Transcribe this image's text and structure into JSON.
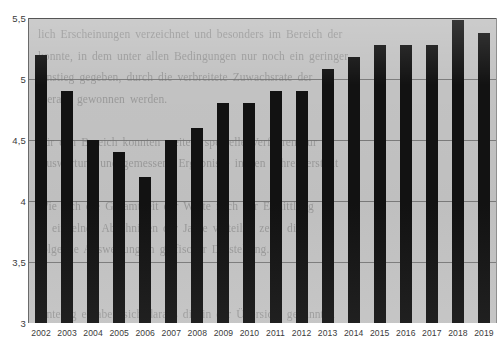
{
  "chart_data": {
    "type": "bar",
    "title": "",
    "subtitle": "",
    "xlabel": "",
    "ylabel": "",
    "categories": [
      "2002",
      "2003",
      "2004",
      "2005",
      "2006",
      "2007",
      "2008",
      "2009",
      "2010",
      "2011",
      "2012",
      "2013",
      "2014",
      "2015",
      "2016",
      "2017",
      "2018",
      "2019"
    ],
    "values": [
      5.2,
      4.9,
      4.5,
      4.4,
      4.2,
      4.5,
      4.6,
      4.8,
      4.8,
      4.9,
      4.9,
      5.08,
      5.18,
      5.28,
      5.28,
      5.28,
      5.48,
      5.38
    ],
    "series": [
      {
        "name": "",
        "values": [
          5.2,
          4.9,
          4.5,
          4.4,
          4.2,
          4.5,
          4.6,
          4.8,
          4.8,
          4.9,
          4.9,
          5.08,
          5.18,
          5.28,
          5.28,
          5.28,
          5.48,
          5.38
        ]
      }
    ],
    "ylim": [
      3,
      5.5
    ],
    "ytick_values": [
      5.5,
      5.0,
      4.5,
      4.0,
      3.5,
      3.0
    ],
    "ytick_labels": [
      "5,5",
      "5",
      "4,5",
      "4",
      "3,5",
      "3"
    ],
    "grid": true,
    "legend": null,
    "legend_position": "none",
    "annotations": []
  },
  "style": {
    "bar_color": "#121212",
    "plot_background": "#c2c2c2",
    "page_background": "#ffffff",
    "gridline_color": "#6e6e6e",
    "tick_label_color": "#3b3b3b"
  },
  "artifacts": {
    "bleed_through_text": "lich Erscheinungen verzeichnet und besonders im Bereich der\nkonnte, in dem unter allen Bedingungen nur noch ein geringer\nAnstieg gegeben, durch die verbreitete Zuwachsrate der\nhieraus gewonnen werden.\n\nFür den Bereich konnten weitere spezielle Verfahren zur\nAuswertung und gemessene Ergebnisse in den Jahren erstellt\n\nWie sich die Gesamtheit der Werte nach der Ermittlung\nin einzelnen Abschnitten der Jahre verteilte, zeigt die\nfolgende Auswertung in grafischer Darstellung.\n\n\nAnteilig ergaben sich daraus die in der Übersicht genannten\n\n\nWerte, die in der folgenden Betrachtung weiterer Abschnitte\nauch für nachfolgende Zeiträume eine entsprechende\nEntwicklung der genannten Größen erkennen lassen."
  }
}
